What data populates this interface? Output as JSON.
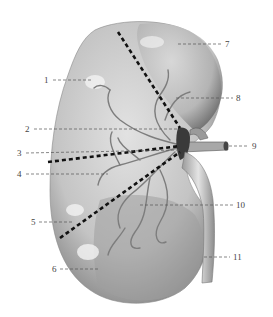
{
  "figure": {
    "colors": {
      "background": "#ffffff",
      "tissue_light": "#e6e6e6",
      "tissue_mid": "#bdbdbd",
      "tissue_dark": "#6e6e6e",
      "vessel": "#8a8a8a",
      "segment_line": "#111111",
      "label_text": "#444444"
    },
    "labels": [
      {
        "id": "1",
        "text": "1",
        "side": "left"
      },
      {
        "id": "2",
        "text": "2",
        "side": "left"
      },
      {
        "id": "3",
        "text": "3",
        "side": "left"
      },
      {
        "id": "4",
        "text": "4",
        "side": "left"
      },
      {
        "id": "5",
        "text": "5",
        "side": "left"
      },
      {
        "id": "6",
        "text": "6",
        "side": "left"
      },
      {
        "id": "7",
        "text": "7",
        "side": "right"
      },
      {
        "id": "8",
        "text": "8",
        "side": "right"
      },
      {
        "id": "9",
        "text": "9",
        "side": "right"
      },
      {
        "id": "10",
        "text": "10",
        "side": "right"
      },
      {
        "id": "11",
        "text": "11",
        "side": "right"
      }
    ]
  }
}
